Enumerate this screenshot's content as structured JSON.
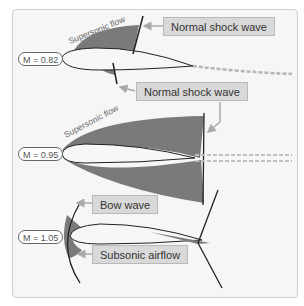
{
  "diagram": {
    "colors": {
      "shaded_region": "#7a7a7a",
      "airfoil_fill": "#f7f7f7",
      "shock_line": "#222222",
      "label_bg": "#d9d9d9",
      "panel_bg": "#f6f6f6",
      "arrow": "#a9a9a9"
    },
    "panels": [
      {
        "mach": "M = 0.82",
        "flow_label": "Supersonic flow",
        "callouts": [
          "Normal shock wave",
          "Normal shock wave"
        ]
      },
      {
        "mach": "M = 0.95",
        "flow_label": "Supersonic flow",
        "callouts": []
      },
      {
        "mach": "M = 1.05",
        "flow_label": "",
        "callouts": [
          "Bow wave",
          "Subsonic airflow"
        ]
      }
    ]
  }
}
